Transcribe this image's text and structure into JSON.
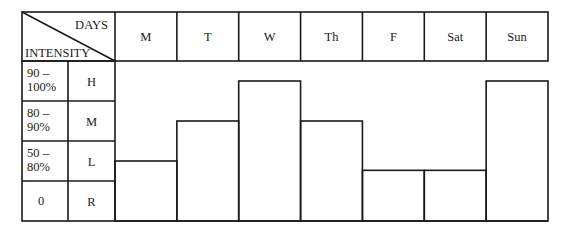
{
  "chart_data": {
    "type": "bar",
    "title": "",
    "header": {
      "columns_label": "DAYS",
      "rows_label": "INTENSITY"
    },
    "categories": [
      "M",
      "T",
      "W",
      "Th",
      "F",
      "Sat",
      "Sun"
    ],
    "intensity_levels": [
      {
        "range": "90 – 100%",
        "range_line1": "90 –",
        "range_line2": "100%",
        "code": "H",
        "low": 90,
        "high": 100
      },
      {
        "range": "80 – 90%",
        "range_line1": "80 –",
        "range_line2": "90%",
        "code": "M",
        "low": 80,
        "high": 90
      },
      {
        "range": "50 – 80%",
        "range_line1": "50 –",
        "range_line2": "80%",
        "code": "L",
        "low": 50,
        "high": 80
      },
      {
        "range": "0",
        "range_line1": "0",
        "range_line2": "",
        "code": "R",
        "low": 0,
        "high": 50
      }
    ],
    "values": [
      65,
      85,
      95,
      85,
      58,
      58,
      95
    ],
    "ylabel": "Intensity (%)",
    "xlabel": "Days"
  }
}
